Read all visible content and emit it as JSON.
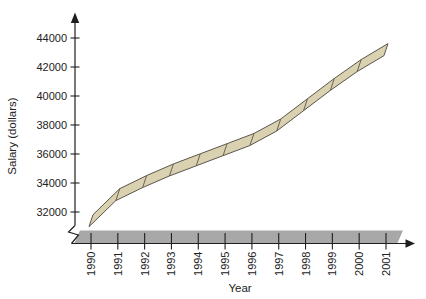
{
  "figure": {
    "background": "#ffffff"
  },
  "chart_data": {
    "type": "line",
    "style": "3d-ribbon",
    "title": "",
    "xlabel": "Year",
    "ylabel": "Salary (dollars)",
    "categories": [
      "1990",
      "1991",
      "1992",
      "1993",
      "1994",
      "1995",
      "1996",
      "1997",
      "1998",
      "1999",
      "2000",
      "2001"
    ],
    "series": [
      {
        "name": "Salary",
        "values": [
          31400,
          33200,
          34100,
          34900,
          35600,
          36300,
          37000,
          38000,
          39400,
          40800,
          42100,
          43200
        ]
      }
    ],
    "y_ticks": [
      44000,
      42000,
      40000,
      38000,
      36000,
      34000,
      32000
    ],
    "ylim": [
      31000,
      45000
    ],
    "y_axis_break": true,
    "grid": false,
    "legend": "none",
    "x_tick_label_rotation_deg": -90,
    "colors": {
      "ribbon_fill": "#d9d1b0",
      "ribbon_stroke": "#5b564c",
      "floor_band": "#a8a8a8",
      "axis": "#1f1f1f",
      "text": "#222222"
    }
  }
}
